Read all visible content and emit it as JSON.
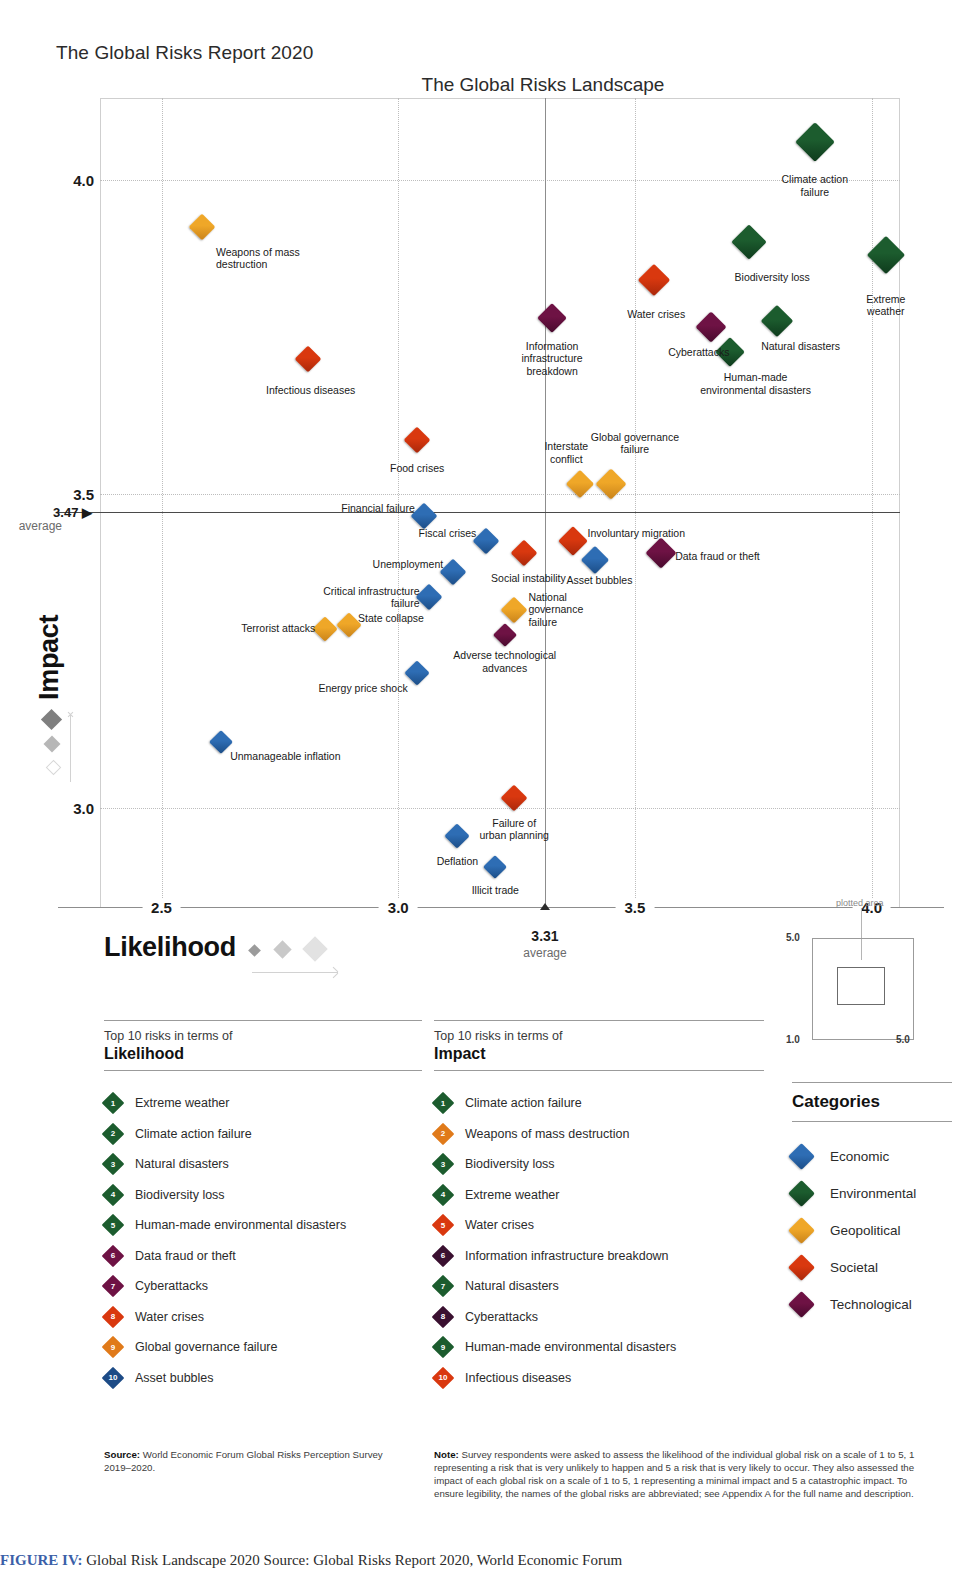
{
  "report_title": "The Global Risks Report 2020",
  "chart_title": "The Global Risks Landscape",
  "axis": {
    "y_label": "Impact",
    "x_label": "Likelihood",
    "y_ticks": [
      "4.0",
      "3.5",
      "3.0"
    ],
    "x_ticks": [
      "2.5",
      "3.0",
      "3.5",
      "4.0"
    ],
    "y_average_value": "3.47",
    "y_average_sub": "average",
    "x_average_value": "3.31",
    "x_average_sub": "average"
  },
  "inset": {
    "label": "plotted\narea",
    "top_left": "5.0",
    "bottom_left": "1.0",
    "bottom_right": "5.0"
  },
  "categories": {
    "title": "Categories",
    "items": [
      {
        "label": "Economic",
        "color": "#2e6db4"
      },
      {
        "label": "Environmental",
        "color": "#1c5c2e"
      },
      {
        "label": "Geopolitical",
        "color": "#efa728"
      },
      {
        "label": "Societal",
        "color": "#d9380f"
      },
      {
        "label": "Technological",
        "color": "#6e1244"
      }
    ]
  },
  "top_likelihood": {
    "kicker": "Top 10 risks in terms of",
    "heading": "Likelihood",
    "items": [
      {
        "rank": "1",
        "label": "Extreme weather",
        "color": "#1c5c2e"
      },
      {
        "rank": "2",
        "label": "Climate action failure",
        "color": "#1c5c2e"
      },
      {
        "rank": "3",
        "label": "Natural disasters",
        "color": "#1c5c2e"
      },
      {
        "rank": "4",
        "label": "Biodiversity loss",
        "color": "#1c5c2e"
      },
      {
        "rank": "5",
        "label": "Human-made environmental disasters",
        "color": "#1c5c2e"
      },
      {
        "rank": "6",
        "label": "Data fraud or theft",
        "color": "#6e1244"
      },
      {
        "rank": "7",
        "label": "Cyberattacks",
        "color": "#6e1244"
      },
      {
        "rank": "8",
        "label": "Water crises",
        "color": "#d9380f"
      },
      {
        "rank": "9",
        "label": "Global governance failure",
        "color": "#e07a1a"
      },
      {
        "rank": "10",
        "label": "Asset bubbles",
        "color": "#1d4b86"
      }
    ]
  },
  "top_impact": {
    "kicker": "Top 10 risks in terms of",
    "heading": "Impact",
    "items": [
      {
        "rank": "1",
        "label": "Climate action failure",
        "color": "#1c5c2e"
      },
      {
        "rank": "2",
        "label": "Weapons of mass destruction",
        "color": "#e07a1a"
      },
      {
        "rank": "3",
        "label": "Biodiversity loss",
        "color": "#1c5c2e"
      },
      {
        "rank": "4",
        "label": "Extreme weather",
        "color": "#1c5c2e"
      },
      {
        "rank": "5",
        "label": "Water crises",
        "color": "#d9380f"
      },
      {
        "rank": "6",
        "label": "Information infrastructure breakdown",
        "color": "#3a1030"
      },
      {
        "rank": "7",
        "label": "Natural disasters",
        "color": "#1c5c2e"
      },
      {
        "rank": "8",
        "label": "Cyberattacks",
        "color": "#3a1030"
      },
      {
        "rank": "9",
        "label": "Human-made environmental disasters",
        "color": "#1c5c2e"
      },
      {
        "rank": "10",
        "label": "Infectious diseases",
        "color": "#d9380f"
      }
    ]
  },
  "source_note": {
    "label": "Source:",
    "text": " World Economic Forum Global Risks Perception Survey 2019–2020."
  },
  "method_note": {
    "label": "Note:",
    "text": " Survey respondents were asked to assess the likelihood of the individual global risk on a scale of 1 to 5, 1 representing a risk that is very unlikely to happen and 5 a risk that is very likely to occur. They also assessed the impact of each global risk on a scale of 1 to 5, 1 representing a minimal impact and 5 a catastrophic impact. To ensure legibility, the names of the global risks are abbreviated; see Appendix A for the full name and description."
  },
  "caption": {
    "figure": "FIGURE IV:",
    "text": "  Global Risk Landscape 2020 Source: Global Risks Report 2020, World Economic Forum"
  },
  "chart_data": {
    "type": "scatter",
    "title": "The Global Risks Landscape",
    "xlabel": "Likelihood",
    "ylabel": "Impact",
    "xlim": [
      2.37,
      4.06
    ],
    "ylim": [
      2.84,
      4.13
    ],
    "grid": true,
    "x_average": 3.31,
    "y_average": 3.47,
    "legend_position": "bottom-right",
    "series": [
      {
        "name": "Economic",
        "color": "#2e6db4"
      },
      {
        "name": "Environmental",
        "color": "#1c5c2e"
      },
      {
        "name": "Geopolitical",
        "color": "#efa728"
      },
      {
        "name": "Societal",
        "color": "#d9380f"
      },
      {
        "name": "Technological",
        "color": "#6e1244"
      }
    ],
    "points": [
      {
        "label": "Climate action\nfailure",
        "x": 3.88,
        "y": 4.06,
        "cat": "Environmental",
        "size": 28,
        "lx": 3.88,
        "ly": 4.01,
        "align": "c"
      },
      {
        "label": "Extreme weather",
        "x": 4.03,
        "y": 3.88,
        "cat": "Environmental",
        "size": 27,
        "lx": 4.03,
        "ly": 3.82,
        "align": "c"
      },
      {
        "label": "Biodiversity loss",
        "x": 3.74,
        "y": 3.9,
        "cat": "Environmental",
        "size": 25,
        "lx": 3.79,
        "ly": 3.855,
        "align": "c"
      },
      {
        "label": "Natural disasters",
        "x": 3.8,
        "y": 3.775,
        "cat": "Environmental",
        "size": 23,
        "lx": 3.85,
        "ly": 3.745,
        "align": "c"
      },
      {
        "label": "Human-made\nenvironmental disasters",
        "x": 3.7,
        "y": 3.725,
        "cat": "Environmental",
        "size": 21,
        "lx": 3.755,
        "ly": 3.695,
        "align": "c"
      },
      {
        "label": "Water crises",
        "x": 3.54,
        "y": 3.84,
        "cat": "Societal",
        "size": 23,
        "lx": 3.545,
        "ly": 3.795,
        "align": "c"
      },
      {
        "label": "Cyberattacks",
        "x": 3.66,
        "y": 3.765,
        "cat": "Technological",
        "size": 22,
        "lx": 3.635,
        "ly": 3.735,
        "align": "c"
      },
      {
        "label": "Information\ninfrastructure\nbreakdown",
        "x": 3.325,
        "y": 3.78,
        "cat": "Technological",
        "size": 21,
        "lx": 3.325,
        "ly": 3.745,
        "align": "c"
      },
      {
        "label": "Weapons of mass\ndestruction",
        "x": 2.585,
        "y": 3.925,
        "cat": "Geopolitical",
        "size": 19,
        "lx": 2.615,
        "ly": 3.895,
        "align": "l"
      },
      {
        "label": "Infectious diseases",
        "x": 2.81,
        "y": 3.715,
        "cat": "Societal",
        "size": 19,
        "lx": 2.815,
        "ly": 3.675,
        "align": "c"
      },
      {
        "label": "Food crises",
        "x": 3.04,
        "y": 3.585,
        "cat": "Societal",
        "size": 19,
        "lx": 3.04,
        "ly": 3.55,
        "align": "c"
      },
      {
        "label": "Interstate\nconflict",
        "x": 3.385,
        "y": 3.515,
        "cat": "Geopolitical",
        "size": 20,
        "lx": 3.355,
        "ly": 3.585,
        "align": "c"
      },
      {
        "label": "Global governance\nfailure",
        "x": 3.45,
        "y": 3.515,
        "cat": "Geopolitical",
        "size": 22,
        "lx": 3.5,
        "ly": 3.6,
        "align": "c"
      },
      {
        "label": "Financial failure",
        "x": 3.055,
        "y": 3.465,
        "cat": "Economic",
        "size": 19,
        "lx": 3.035,
        "ly": 3.487,
        "align": "r"
      },
      {
        "label": "Fiscal crises",
        "x": 3.185,
        "y": 3.425,
        "cat": "Economic",
        "size": 19,
        "lx": 3.165,
        "ly": 3.447,
        "align": "r"
      },
      {
        "label": "Social instability",
        "x": 3.265,
        "y": 3.405,
        "cat": "Societal",
        "size": 19,
        "lx": 3.275,
        "ly": 3.375,
        "align": "c"
      },
      {
        "label": "Involuntary migration",
        "x": 3.37,
        "y": 3.425,
        "cat": "Societal",
        "size": 21,
        "lx": 3.4,
        "ly": 3.447,
        "align": "l"
      },
      {
        "label": "Asset bubbles",
        "x": 3.415,
        "y": 3.395,
        "cat": "Economic",
        "size": 20,
        "lx": 3.425,
        "ly": 3.372,
        "align": "c"
      },
      {
        "label": "Data fraud or theft",
        "x": 3.555,
        "y": 3.405,
        "cat": "Technological",
        "size": 22,
        "lx": 3.585,
        "ly": 3.41,
        "align": "l"
      },
      {
        "label": "Unemployment",
        "x": 3.115,
        "y": 3.375,
        "cat": "Economic",
        "size": 19,
        "lx": 3.095,
        "ly": 3.398,
        "align": "r"
      },
      {
        "label": "Critical infrastructure\nfailure",
        "x": 3.065,
        "y": 3.335,
        "cat": "Economic",
        "size": 19,
        "lx": 3.045,
        "ly": 3.355,
        "align": "r"
      },
      {
        "label": "National\ngovernance\nfailure",
        "x": 3.245,
        "y": 3.315,
        "cat": "Geopolitical",
        "size": 19,
        "lx": 3.275,
        "ly": 3.345,
        "align": "l"
      },
      {
        "label": "State collapse",
        "x": 2.895,
        "y": 3.29,
        "cat": "Geopolitical",
        "size": 18,
        "lx": 2.915,
        "ly": 3.312,
        "align": "l"
      },
      {
        "label": "Terrorist attacks",
        "x": 2.845,
        "y": 3.285,
        "cat": "Geopolitical",
        "size": 18,
        "lx": 2.825,
        "ly": 3.295,
        "align": "r"
      },
      {
        "label": "Adverse technological\nadvances",
        "x": 3.225,
        "y": 3.275,
        "cat": "Technological",
        "size": 17,
        "lx": 3.225,
        "ly": 3.252,
        "align": "c"
      },
      {
        "label": "Energy price shock",
        "x": 3.04,
        "y": 3.215,
        "cat": "Economic",
        "size": 18,
        "lx": 3.02,
        "ly": 3.2,
        "align": "r"
      },
      {
        "label": "Unmanageable inflation",
        "x": 2.625,
        "y": 3.105,
        "cat": "Economic",
        "size": 17,
        "lx": 2.645,
        "ly": 3.092,
        "align": "l"
      },
      {
        "label": "Failure of\nurban planning",
        "x": 3.245,
        "y": 3.015,
        "cat": "Societal",
        "size": 19,
        "lx": 3.245,
        "ly": 2.985,
        "align": "c"
      },
      {
        "label": "Deflation",
        "x": 3.125,
        "y": 2.955,
        "cat": "Economic",
        "size": 18,
        "lx": 3.125,
        "ly": 2.925,
        "align": "c"
      },
      {
        "label": "Illicit trade",
        "x": 3.205,
        "y": 2.905,
        "cat": "Economic",
        "size": 17,
        "lx": 3.205,
        "ly": 2.878,
        "align": "c"
      }
    ]
  }
}
